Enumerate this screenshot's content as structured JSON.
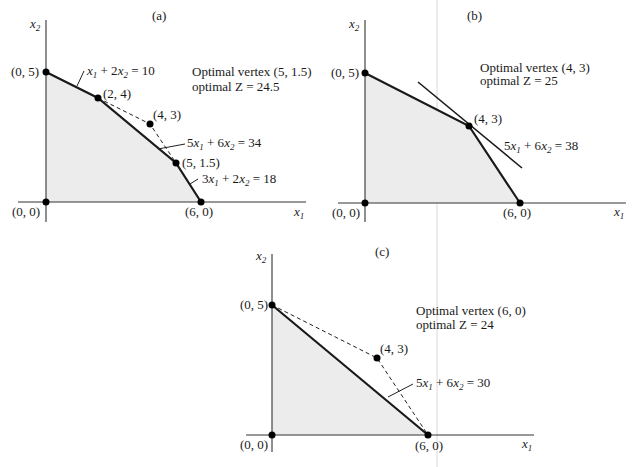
{
  "panels": [
    {
      "id": "a",
      "label": "(a)",
      "axis_x": "x1",
      "axis_y": "x2",
      "vertices": [
        "(0, 0)",
        "(0, 5)",
        "(2, 4)",
        "(5, 1.5)",
        "(6, 0)"
      ],
      "extra_point": "(4, 3)",
      "constraints": [
        "x1 + 2x2 = 10",
        "5x1 + 6x2 = 34",
        "3x1 + 2x2 = 18"
      ],
      "optimal_line1": "Optimal vertex (5, 1.5)",
      "optimal_line2": "optimal Z = 24.5"
    },
    {
      "id": "b",
      "label": "(b)",
      "axis_x": "x1",
      "axis_y": "x2",
      "vertices": [
        "(0, 0)",
        "(0, 5)",
        "(4, 3)",
        "(6, 0)"
      ],
      "constraints": [
        "5x1 + 6x2 = 38"
      ],
      "optimal_line1": "Optimal vertex (4, 3)",
      "optimal_line2": "optimal Z = 25"
    },
    {
      "id": "c",
      "label": "(c)",
      "axis_x": "x1",
      "axis_y": "x2",
      "vertices": [
        "(0, 0)",
        "(0, 5)",
        "(6, 0)"
      ],
      "extra_point": "(4, 3)",
      "constraints": [
        "5x1 + 6x2 = 30"
      ],
      "optimal_line1": "Optimal vertex (6, 0)",
      "optimal_line2": "optimal Z = 24"
    }
  ],
  "text": {
    "a_title": "(a)",
    "a_p00": "(0, 0)",
    "a_p05": "(0, 5)",
    "a_p24": "(2, 4)",
    "a_p43": "(4, 3)",
    "a_p515": "(5, 1.5)",
    "a_p60": "(6, 0)",
    "a_opt1": "Optimal vertex (5, 1.5)",
    "a_opt2": "optimal Z = 24.5",
    "b_title": "(b)",
    "b_p00": "(0, 0)",
    "b_p05": "(0, 5)",
    "b_p43": "(4, 3)",
    "b_p60": "(6, 0)",
    "b_opt1": "Optimal vertex (4, 3)",
    "b_opt2": "optimal Z = 25",
    "c_title": "(c)",
    "c_p00": "(0, 0)",
    "c_p05": "(0, 5)",
    "c_p43": "(4, 3)",
    "c_p60": "(6, 0)",
    "c_opt1": "Optimal vertex (6, 0)",
    "c_opt2": "optimal Z = 24"
  }
}
